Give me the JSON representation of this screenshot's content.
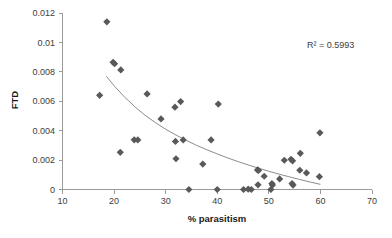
{
  "chart_data": {
    "type": "scatter",
    "title": "",
    "xlabel": "% parasitism",
    "ylabel": "FTD",
    "xlim": [
      10,
      70
    ],
    "ylim": [
      0,
      0.012
    ],
    "xticks": [
      10,
      20,
      30,
      40,
      50,
      60,
      70
    ],
    "yticks": [
      0,
      0.002,
      0.004,
      0.006,
      0.008,
      0.01,
      0.012
    ],
    "xtick_labels": [
      "10",
      "20",
      "30",
      "40",
      "50",
      "60",
      "70"
    ],
    "ytick_labels": [
      "0",
      "0.002",
      "0.004",
      "0.006",
      "0.008",
      "0.01",
      "0.012"
    ],
    "grid": false,
    "legend": false,
    "marker": "diamond",
    "marker_color": "#595959",
    "series": [
      {
        "name": "FTD vs % parasitism",
        "points": [
          [
            17.2,
            0.0064
          ],
          [
            18.6,
            0.0114
          ],
          [
            19.8,
            0.00865
          ],
          [
            20.1,
            0.00855
          ],
          [
            21.3,
            0.00813
          ],
          [
            21.2,
            0.00253
          ],
          [
            23.9,
            0.00338
          ],
          [
            24.6,
            0.00337
          ],
          [
            26.4,
            0.0065
          ],
          [
            29.1,
            0.0048
          ],
          [
            31.8,
            0.0056
          ],
          [
            31.9,
            0.00327
          ],
          [
            32.9,
            0.00598
          ],
          [
            32.0,
            0.00209
          ],
          [
            33.4,
            0.00337
          ],
          [
            34.5,
            0.0
          ],
          [
            37.2,
            0.00173
          ],
          [
            38.8,
            0.00337
          ],
          [
            40.2,
            0.00581
          ],
          [
            40.0,
            0.0
          ],
          [
            45.1,
            0.0
          ],
          [
            46.0,
            2e-05
          ],
          [
            46.6,
            0.0
          ],
          [
            47.8,
            0.00133
          ],
          [
            48.0,
            0.0013
          ],
          [
            47.9,
            0.00032
          ],
          [
            49.1,
            0.0009
          ],
          [
            50.4,
            0.0
          ],
          [
            50.6,
            0.0004
          ],
          [
            50.7,
            0.0003
          ],
          [
            52.1,
            0.00072
          ],
          [
            53.0,
            0.00199
          ],
          [
            54.3,
            0.00205
          ],
          [
            54.6,
            0.00195
          ],
          [
            54.5,
            0.0004
          ],
          [
            54.7,
            0.0003
          ],
          [
            56.1,
            0.00246
          ],
          [
            56.0,
            0.00131
          ],
          [
            57.3,
            0.00113
          ],
          [
            59.9,
            0.00385
          ],
          [
            59.8,
            0.00087
          ]
        ]
      }
    ],
    "trendline": {
      "type": "power-decay",
      "points": [
        [
          18.5,
          0.0077
        ],
        [
          20.0,
          0.00705
        ],
        [
          22.0,
          0.0063
        ],
        [
          24.0,
          0.00563
        ],
        [
          26.0,
          0.00505
        ],
        [
          28.0,
          0.00455
        ],
        [
          30.0,
          0.0041
        ],
        [
          32.0,
          0.0037
        ],
        [
          34.0,
          0.00334
        ],
        [
          36.0,
          0.003
        ],
        [
          38.0,
          0.0027
        ],
        [
          40.0,
          0.00242
        ],
        [
          42.0,
          0.00215
        ],
        [
          44.0,
          0.0019
        ],
        [
          46.0,
          0.00167
        ],
        [
          48.0,
          0.00145
        ],
        [
          50.0,
          0.00124
        ],
        [
          52.0,
          0.00104
        ],
        [
          54.0,
          0.00086
        ],
        [
          56.0,
          0.00068
        ],
        [
          58.0,
          0.00051
        ],
        [
          60.0,
          0.00035
        ]
      ]
    },
    "annotations": [
      {
        "name": "r-squared",
        "text": "R² = 0.5993",
        "x": 62.0,
        "y": 0.00965
      }
    ]
  }
}
